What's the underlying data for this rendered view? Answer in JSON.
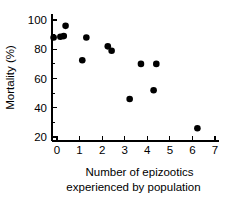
{
  "chart_data": {
    "type": "scatter",
    "title": "",
    "xlabel": "Number of epizootics experienced by population",
    "xlabel_line1": "Number of epizootics",
    "xlabel_line2": "experienced by population",
    "ylabel": "Mortality (%)",
    "xlim": [
      -0.35,
      7.0
    ],
    "ylim": [
      17,
      103
    ],
    "xticks": [
      0,
      1,
      2,
      3,
      4,
      5,
      6,
      7
    ],
    "xtick_labels": [
      "0",
      "1",
      "2",
      "3",
      "4",
      "5",
      "6",
      "7"
    ],
    "yticks": [
      20,
      40,
      60,
      80,
      100
    ],
    "ytick_labels": [
      "20",
      "40",
      "60",
      "80",
      "100"
    ],
    "yminorticks": [
      30,
      50,
      70,
      90
    ],
    "grid": false,
    "legend": false,
    "marker": "filled-circle",
    "marker_color": "#000000",
    "marker_size": 4.6,
    "points": [
      {
        "x": -0.15,
        "y": 88
      },
      {
        "x": 0.15,
        "y": 88.5
      },
      {
        "x": 0.3,
        "y": 89
      },
      {
        "x": 0.38,
        "y": 96
      },
      {
        "x": 1.12,
        "y": 72.5
      },
      {
        "x": 1.3,
        "y": 88
      },
      {
        "x": 2.25,
        "y": 82
      },
      {
        "x": 2.42,
        "y": 79
      },
      {
        "x": 3.22,
        "y": 46
      },
      {
        "x": 3.72,
        "y": 70
      },
      {
        "x": 4.28,
        "y": 52
      },
      {
        "x": 4.4,
        "y": 70
      },
      {
        "x": 6.22,
        "y": 26
      }
    ]
  }
}
